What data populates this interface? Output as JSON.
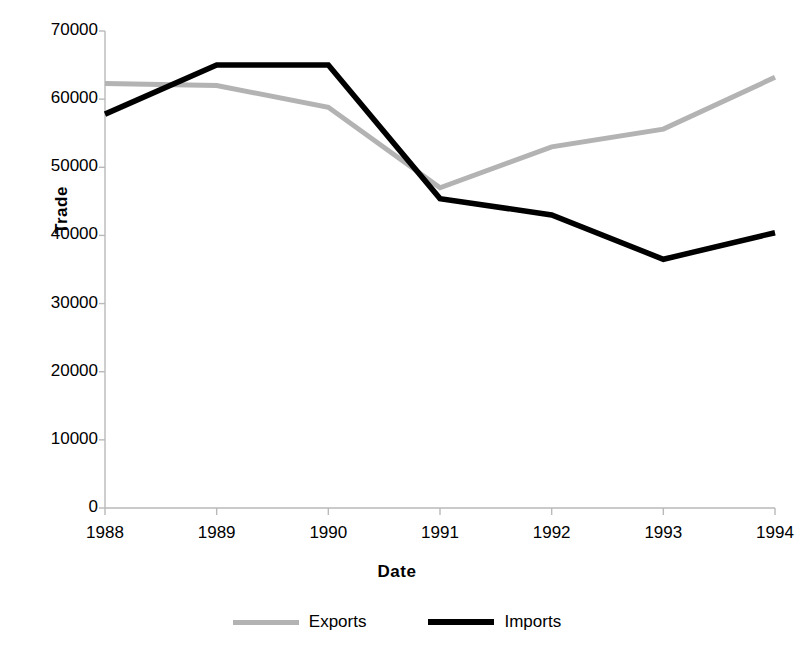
{
  "chart_data": {
    "type": "line",
    "title": "",
    "xlabel": "Date",
    "ylabel": "Trade",
    "categories": [
      "1988",
      "1989",
      "1990",
      "1991",
      "1992",
      "1993",
      "1994"
    ],
    "x": [
      1988,
      1989,
      1990,
      1991,
      1992,
      1993,
      1994
    ],
    "series": [
      {
        "name": "Exports",
        "color": "#b3b3b3",
        "values": [
          62300,
          62000,
          58800,
          47000,
          53000,
          55600,
          63200
        ]
      },
      {
        "name": "Imports",
        "color": "#000000",
        "values": [
          57800,
          65000,
          65000,
          45400,
          43000,
          36500,
          40400
        ]
      }
    ],
    "ylim": [
      0,
      70000
    ],
    "ytick_labels": [
      "0",
      "10000",
      "20000",
      "30000",
      "40000",
      "50000",
      "60000",
      "70000"
    ],
    "ytick_values": [
      0,
      10000,
      20000,
      30000,
      40000,
      50000,
      60000,
      70000
    ],
    "xtick_labels": [
      "1988",
      "1989",
      "1990",
      "1991",
      "1992",
      "1993",
      "1994"
    ],
    "grid": false,
    "legend_position": "bottom",
    "legend": [
      {
        "label": "Exports",
        "color": "#b3b3b3"
      },
      {
        "label": "Imports",
        "color": "#000000"
      }
    ]
  },
  "axes": {
    "y_title": "Trade",
    "x_title": "Date"
  }
}
